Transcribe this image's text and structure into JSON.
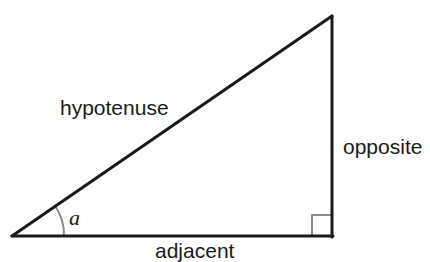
{
  "diagram": {
    "type": "right-triangle",
    "labels": {
      "hypotenuse": "hypotenuse",
      "opposite": "opposite",
      "adjacent": "adjacent",
      "angle": "a"
    },
    "colors": {
      "stroke": "#1a1a1a",
      "marker": "#8a8a8a"
    }
  }
}
